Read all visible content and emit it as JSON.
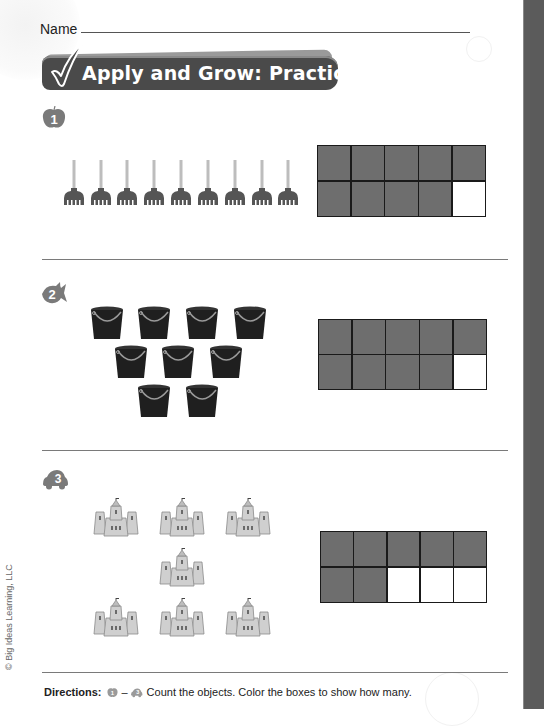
{
  "page": {
    "name_label": "Name",
    "banner_title": "Apply and Grow: Practice",
    "copyright": "© Big Ideas Learning, LLC",
    "colors": {
      "banner": "#4a4a4a",
      "filled_box": "#6e6e6e",
      "edge_strip": "#5b5b5b"
    }
  },
  "problems": [
    {
      "number": "1",
      "badge_icon": "apple-icon",
      "object": "rake",
      "object_count": 9,
      "layout": "single row of 9",
      "ten_frame": {
        "filled": 9,
        "total": 10
      }
    },
    {
      "number": "2",
      "badge_icon": "fish-icon",
      "object": "bucket",
      "object_count": 9,
      "layout": "rows of 4, 3, 2",
      "ten_frame": {
        "filled": 9,
        "total": 10
      }
    },
    {
      "number": "3",
      "badge_icon": "car-icon",
      "object": "sandcastle",
      "object_count": 7,
      "layout": "rows of 3, 1, 3",
      "ten_frame": {
        "filled": 7,
        "total": 10
      }
    }
  ],
  "directions": {
    "label": "Directions:",
    "range_start": "1",
    "range_dash": "–",
    "range_end": "3",
    "text": "Count the objects. Color the boxes to show how many."
  }
}
